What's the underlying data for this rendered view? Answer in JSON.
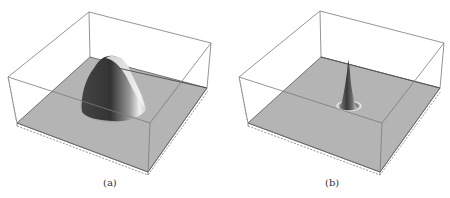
{
  "figure": {
    "panels": [
      {
        "label": "(a)",
        "description": "3D surface plot of a broad smooth Gaussian-like bump on a flat gray plane inside a wireframe bounding box",
        "peak_shape": "broad"
      },
      {
        "label": "(b)",
        "description": "3D surface plot of a narrow sharp spike on a flat gray plane inside a wireframe bounding box",
        "peak_shape": "narrow"
      }
    ],
    "colors": {
      "floor": "#b4b4b4",
      "box_edge": "#707070",
      "background": "#ffffff"
    }
  }
}
